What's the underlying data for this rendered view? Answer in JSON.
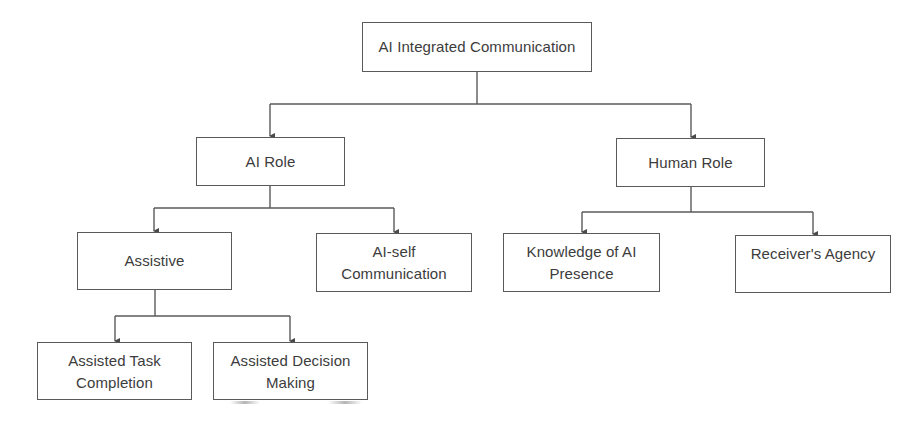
{
  "diagram": {
    "type": "hierarchy-tree",
    "colors": {
      "line": "#5a5a5a",
      "box_border": "#5a5a5a",
      "text": "#3c3c3c",
      "background": "#ffffff"
    },
    "root": {
      "label": "AI Integrated Communication"
    },
    "level1": {
      "ai_role": {
        "label": "AI Role"
      },
      "human_role": {
        "label": "Human Role"
      }
    },
    "level2": {
      "assistive": {
        "label": "Assistive"
      },
      "ai_self": {
        "label": "AI-self\nCommunication"
      },
      "knowledge": {
        "label": "Knowledge of AI\nPresence"
      },
      "receiver": {
        "label": "Receiver's Agency"
      }
    },
    "level3": {
      "task": {
        "label": "Assisted Task\nCompletion"
      },
      "decision": {
        "label": "Assisted Decision\nMaking"
      }
    },
    "edges": [
      [
        "AI Integrated Communication",
        "AI Role"
      ],
      [
        "AI Integrated Communication",
        "Human Role"
      ],
      [
        "AI Role",
        "Assistive"
      ],
      [
        "AI Role",
        "AI-self Communication"
      ],
      [
        "Human Role",
        "Knowledge of AI Presence"
      ],
      [
        "Human Role",
        "Receiver's Agency"
      ],
      [
        "Assistive",
        "Assisted Task Completion"
      ],
      [
        "Assistive",
        "Assisted Decision Making"
      ]
    ]
  }
}
